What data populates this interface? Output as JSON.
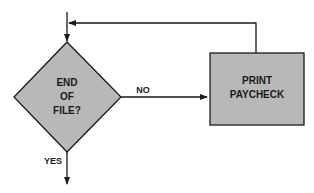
{
  "diagram": {
    "type": "flowchart",
    "colors": {
      "shape_fill": "#b8b8b8",
      "stroke": "#1a1a1a",
      "background": "#ffffff"
    },
    "nodes": [
      {
        "id": "decision",
        "shape": "diamond",
        "lines": [
          "END",
          "OF",
          "FILE?"
        ]
      },
      {
        "id": "process",
        "shape": "rectangle",
        "lines": [
          "PRINT",
          "PAYCHECK"
        ]
      }
    ],
    "edges": [
      {
        "from": "entry",
        "to": "decision",
        "label": ""
      },
      {
        "from": "decision",
        "to": "process",
        "label": "NO"
      },
      {
        "from": "process",
        "to": "decision",
        "label": ""
      },
      {
        "from": "decision",
        "to": "exit",
        "label": "YES"
      }
    ]
  }
}
